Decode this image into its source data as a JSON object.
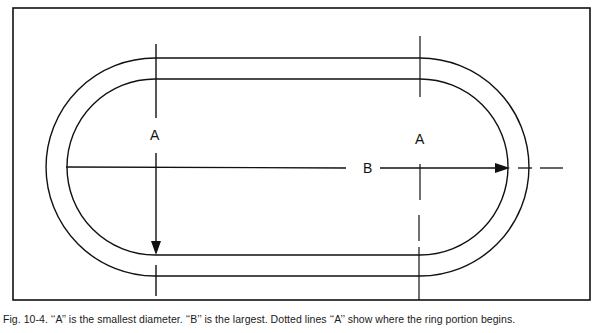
{
  "figure": {
    "labels": {
      "left_a": "A",
      "right_a": "A",
      "b": "B"
    },
    "caption": "Fig. 10-4. ‘‘A’’ is the smallest diameter. ‘‘B’’ is the largest. Dotted lines ‘‘A’’ show where the ring portion begins.",
    "colors": {
      "line": "#111111",
      "background": "#ffffff"
    }
  }
}
